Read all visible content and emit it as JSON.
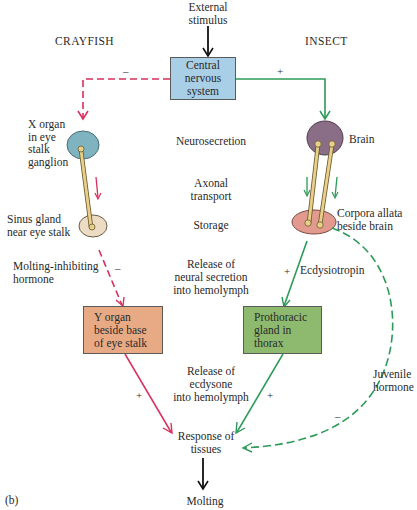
{
  "figure_label": "(b)",
  "headings": {
    "left": "CRAYFISH",
    "right": "INSECT"
  },
  "stimulus": {
    "line1": "External",
    "line2": "stimulus"
  },
  "cns_box": {
    "line1": "Central",
    "line2": "nervous",
    "line3": "system",
    "color": "#a9cfe6"
  },
  "stages": {
    "neurosecretion": "Neurosecretion",
    "axonal1": "Axonal",
    "axonal2": "transport",
    "storage": "Storage",
    "release_neural1": "Release of",
    "release_neural2": "neural secretion",
    "release_neural3": "into hemolymph",
    "release_ecdysone1": "Release of",
    "release_ecdysone2": "ecdysone",
    "release_ecdysone3": "into hemolymph"
  },
  "crayfish": {
    "x_organ": [
      "X organ",
      "in eye",
      "stalk",
      "ganglion"
    ],
    "sinus_gland": [
      "Sinus gland",
      "near eye stalk"
    ],
    "hormone": [
      "Molting-inhibiting",
      "hormone"
    ],
    "y_organ": [
      "Y organ",
      "beside base",
      "of eye stalk"
    ],
    "x_organ_color": "#7fb3bf",
    "sinus_color": "#ecdcc4",
    "y_organ_color": "#e8aa85",
    "arrow_color": "#d8305c",
    "sign_cns": "–",
    "sign_hormone": "–",
    "sign_ecdysone": "+"
  },
  "insect": {
    "brain": "Brain",
    "corpora": [
      "Corpora allata",
      "beside brain"
    ],
    "ecdysiotropin": "Ecdysiotropin",
    "prothoracic": [
      "Prothoracic",
      "gland in",
      "thorax"
    ],
    "juvenile": [
      "Juvenile",
      "hormone"
    ],
    "brain_color": "#8a6d86",
    "corpora_color": "#e29a8e",
    "prothoracic_color": "#8dba6e",
    "arrow_color": "#2e9a5a",
    "sign_cns": "+",
    "sign_ecdysiotropin": "+",
    "sign_ecdysone": "+",
    "sign_juvenile": "–"
  },
  "response": {
    "line1": "Response of",
    "line2": "tissues"
  },
  "outcome": "Molting"
}
